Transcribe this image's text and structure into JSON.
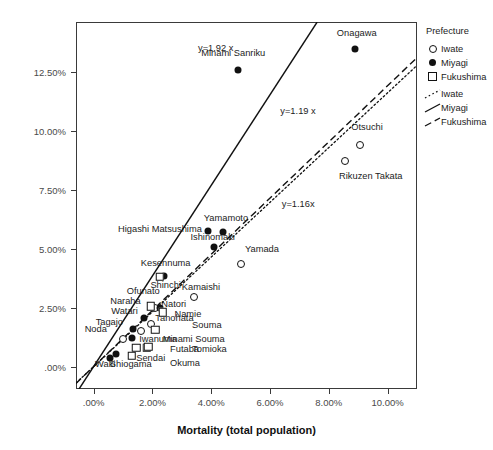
{
  "chart_data": {
    "type": "scatter",
    "title": "",
    "xlabel": "Mortality (total population)",
    "ylabel": "PWD mortality",
    "xlim": [
      -0.6,
      11.0
    ],
    "ylim": [
      -0.95,
      14.6
    ],
    "grid": false,
    "xticks": [
      ".00%",
      "2.00%",
      "4.00%",
      "6.00%",
      "8.00%",
      "10.00%"
    ],
    "xtick_values": [
      0,
      2,
      4,
      6,
      8,
      10
    ],
    "yticks": [
      ".00%",
      "2.50%",
      "5.00%",
      "7.50%",
      "10.00%",
      "12.50%"
    ],
    "ytick_values": [
      0,
      2.5,
      5.0,
      7.5,
      10.0,
      12.5
    ],
    "legend_position": "right",
    "series": [
      {
        "name": "Iwate",
        "marker": "open-circle",
        "line_style": "dotted",
        "points": [
          {
            "label": "Otsuchi",
            "x": 9.05,
            "y": 9.4,
            "label_pos": "c",
            "lx": 9.3,
            "ly": 10.1
          },
          {
            "label": "Rikuzen Takata",
            "x": 8.55,
            "y": 8.7,
            "label_pos": "l",
            "lx": 8.35,
            "ly": 8.05
          },
          {
            "label": "Yamada",
            "x": 5.0,
            "y": 4.35,
            "label_pos": "l",
            "lx": 5.15,
            "ly": 4.95
          },
          {
            "label": "Kamaishi",
            "x": 3.4,
            "y": 2.95,
            "label_pos": "l",
            "lx": 3.0,
            "ly": 3.35
          },
          {
            "label": "Ofunato",
            "x": 2.1,
            "y": 2.5,
            "label_pos": "r",
            "lx": 2.25,
            "ly": 3.15
          },
          {
            "label": "Tanohata",
            "x": 1.95,
            "y": 1.8,
            "label_pos": "l",
            "lx": 2.1,
            "ly": 2.0
          },
          {
            "label": "Iwanuma",
            "x": 1.6,
            "y": 1.5,
            "label_pos": "l",
            "lx": 1.55,
            "ly": 1.12
          },
          {
            "label": "Noda",
            "x": 1.0,
            "y": 1.15,
            "label_pos": "r",
            "lx": 0.45,
            "ly": 1.55
          }
        ]
      },
      {
        "name": "Miyagi",
        "marker": "filled-circle",
        "line_style": "solid",
        "points": [
          {
            "label": "Onagawa",
            "x": 8.9,
            "y": 13.45,
            "label_pos": "c",
            "lx": 8.95,
            "ly": 14.1
          },
          {
            "label": "Minami Sanriku",
            "x": 4.9,
            "y": 12.55,
            "label_pos": "c",
            "lx": 4.75,
            "ly": 13.25
          },
          {
            "label": "Higashi Matsushima",
            "x": 3.9,
            "y": 5.75,
            "label_pos": "r",
            "lx": 3.68,
            "ly": 5.8
          },
          {
            "label": "Ishinomaki",
            "x": 4.1,
            "y": 5.05,
            "label_pos": "c",
            "lx": 4.05,
            "ly": 5.45
          },
          {
            "label": "Yamamoto",
            "x": 4.4,
            "y": 5.7,
            "label_pos": "c",
            "lx": 4.5,
            "ly": 6.25
          },
          {
            "label": "Kesennuma",
            "x": 2.4,
            "y": 3.85,
            "label_pos": "c",
            "lx": 2.45,
            "ly": 4.35
          },
          {
            "label": "Natori",
            "x": 2.25,
            "y": 2.5,
            "label_pos": "l",
            "lx": 2.3,
            "ly": 2.6
          },
          {
            "label": "Watari",
            "x": 1.7,
            "y": 2.05,
            "label_pos": "r",
            "lx": 1.5,
            "ly": 2.3
          },
          {
            "label": "Tagajo",
            "x": 1.35,
            "y": 1.6,
            "label_pos": "r",
            "lx": 1.0,
            "ly": 1.85
          },
          {
            "label": "Minami Souma",
            "x": 1.3,
            "y": 1.2,
            "label_pos": "l",
            "lx": 2.35,
            "ly": 1.12
          },
          {
            "label": "Shiogama",
            "x": 0.75,
            "y": 0.55,
            "label_pos": "l",
            "lx": 0.55,
            "ly": 0.05
          },
          {
            "label": "Waki",
            "x": 0.55,
            "y": 0.35,
            "label_pos": "l",
            "lx": 0.05,
            "ly": 0.05
          }
        ]
      },
      {
        "name": "Fukushima",
        "marker": "open-square",
        "line_style": "dashed",
        "points": [
          {
            "label": "Shinchi",
            "x": 2.25,
            "y": 3.8,
            "label_pos": "c",
            "lx": 2.45,
            "ly": 3.4
          },
          {
            "label": "Naraha",
            "x": 1.95,
            "y": 2.55,
            "label_pos": "r",
            "lx": 1.6,
            "ly": 2.75
          },
          {
            "label": "Namie",
            "x": 2.35,
            "y": 2.3,
            "label_pos": "l",
            "lx": 2.75,
            "ly": 2.18
          },
          {
            "label": "Souma",
            "x": 2.1,
            "y": 1.55,
            "label_pos": "l",
            "lx": 3.35,
            "ly": 1.7
          },
          {
            "label": "Futaba",
            "x": 1.8,
            "y": 0.8,
            "label_pos": "l",
            "lx": 2.6,
            "ly": 0.72
          },
          {
            "label": "Tomioka",
            "x": 1.85,
            "y": 0.85,
            "label_pos": "l",
            "lx": 3.35,
            "ly": 0.72
          },
          {
            "label": "Sendai",
            "x": 1.3,
            "y": 0.45,
            "label_pos": "l",
            "lx": 1.45,
            "ly": 0.3
          },
          {
            "label": "Okuma",
            "x": 1.45,
            "y": 0.8,
            "label_pos": "l",
            "lx": 2.6,
            "ly": 0.1
          }
        ]
      }
    ],
    "fit_lines": [
      {
        "name": "Miyagi",
        "equation": "y=1.92 x",
        "slope": 1.92,
        "style": "solid",
        "eq_x": 3.55,
        "eq_y": 13.7
      },
      {
        "name": "Fukushima",
        "equation": "y=1.19 x",
        "slope": 1.19,
        "style": "dashed",
        "eq_x": 6.35,
        "eq_y": 11.05
      },
      {
        "name": "Iwate",
        "equation": "y=1.16x",
        "slope": 1.16,
        "style": "dotted",
        "eq_x": 6.4,
        "eq_y": 7.1
      }
    ]
  },
  "legend": {
    "title": "Prefecture",
    "marker_entries": [
      {
        "label": "Iwate",
        "key": "open-circle"
      },
      {
        "label": "Miyagi",
        "key": "filled-circle"
      },
      {
        "label": "Fukushima",
        "key": "open-square"
      }
    ],
    "line_entries": [
      {
        "label": "Iwate",
        "key": "dotted-line"
      },
      {
        "label": "Miyagi",
        "key": "solid-line"
      },
      {
        "label": "Fukushima",
        "key": "dashed-line"
      }
    ]
  },
  "colors": {
    "ink": "#111111",
    "axis": "#3a3a3a",
    "tick_text": "#4a4a4a",
    "background": "#ffffff"
  }
}
